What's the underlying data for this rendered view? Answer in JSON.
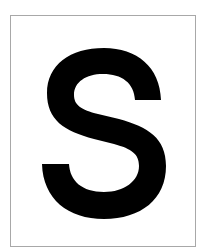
{
  "card": {
    "letter": "S",
    "letter_color": "#000000",
    "background_color": "#ffffff",
    "border_color": "#a8a8a8"
  }
}
